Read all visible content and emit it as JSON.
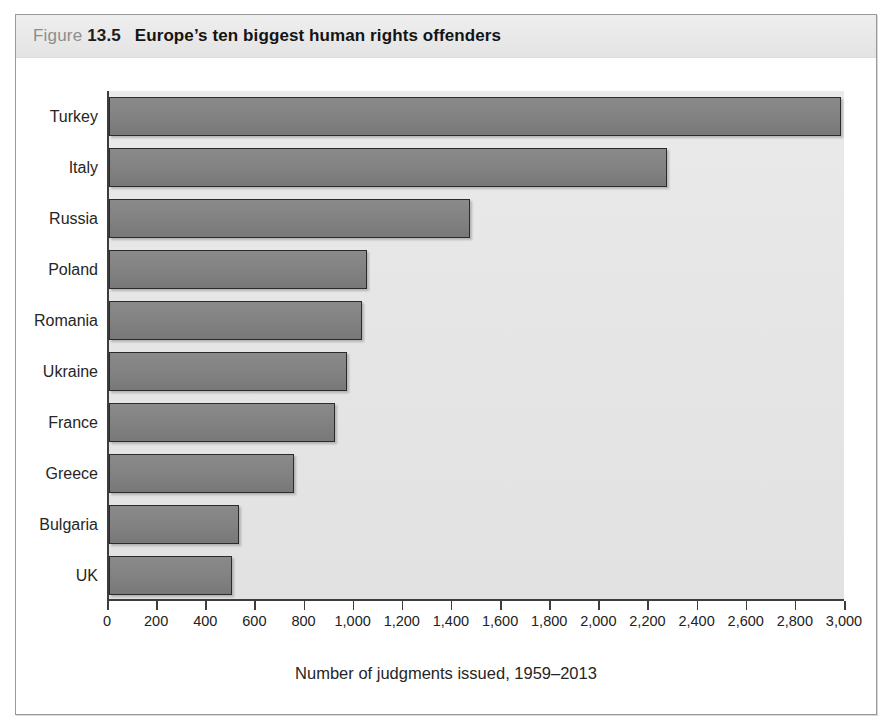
{
  "figure": {
    "label_word": "Figure",
    "number": "13.5",
    "caption": "Europe’s ten biggest human rights offenders"
  },
  "colors": {
    "bar_fill": "#828282",
    "bar_stroke": "#2b2b2b",
    "plot_background": "#e6e6e6",
    "title_band": "#e9e9e9",
    "frame_border": "#9a9a9a",
    "axis_line": "#3d3d3d",
    "text": "#262626"
  },
  "chart_data": {
    "type": "bar",
    "orientation": "horizontal",
    "title": "Europe’s ten biggest human rights offenders",
    "xlabel": "Number of judgments issued, 1959–2013",
    "ylabel": "",
    "xlim": [
      0,
      3000
    ],
    "grid": false,
    "legend": "none",
    "categories": [
      "Turkey",
      "Italy",
      "Russia",
      "Poland",
      "Romania",
      "Ukraine",
      "France",
      "Greece",
      "Bulgaria",
      "UK"
    ],
    "values": [
      2980,
      2270,
      1470,
      1050,
      1030,
      970,
      920,
      755,
      530,
      500
    ],
    "xticks": [
      0,
      200,
      400,
      600,
      800,
      1000,
      1200,
      1400,
      1600,
      1800,
      2000,
      2200,
      2400,
      2600,
      2800,
      3000
    ],
    "xticklabels": [
      "0",
      "200",
      "400",
      "600",
      "800",
      "1,000",
      "1,200",
      "1,400",
      "1,600",
      "1,800",
      "2,000",
      "2,200",
      "2,400",
      "2,600",
      "2,800",
      "3,000"
    ]
  }
}
